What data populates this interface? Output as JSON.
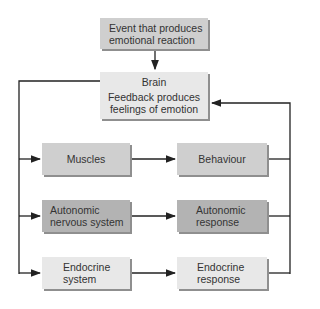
{
  "diagram": {
    "event": {
      "line1": "Event that produces",
      "line2": "emotional reaction"
    },
    "brain": {
      "title": "Brain",
      "line1": "Feedback produces",
      "line2": "feelings of emotion"
    },
    "rows": [
      {
        "input": {
          "line1": "Muscles",
          "line2": ""
        },
        "output": {
          "line1": "Behaviour",
          "line2": ""
        }
      },
      {
        "input": {
          "line1": "Autonomic",
          "line2": "nervous system"
        },
        "output": {
          "line1": "Autonomic",
          "line2": "response"
        }
      },
      {
        "input": {
          "line1": "Endocrine",
          "line2": "system"
        },
        "output": {
          "line1": "Endocrine",
          "line2": "response"
        }
      }
    ],
    "colors": {
      "mid": "#cfcfcf",
      "dark": "#b3b3b3",
      "light": "#e8e8e8",
      "line": "#222222"
    }
  }
}
